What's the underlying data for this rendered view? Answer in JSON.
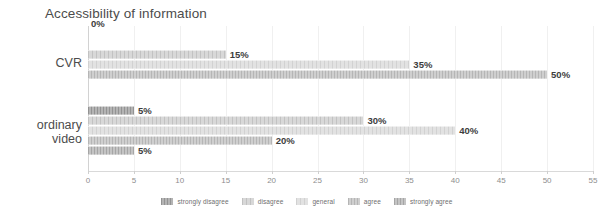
{
  "chart_data": {
    "type": "bar",
    "orientation": "horizontal",
    "title": "Accessibility of information",
    "xlabel": "",
    "ylabel": "",
    "xlim": [
      0,
      55
    ],
    "xticks": [
      0,
      5,
      10,
      15,
      20,
      25,
      30,
      35,
      40,
      45,
      50,
      55
    ],
    "xtick_labels": [
      "0",
      "5",
      "10",
      "15",
      "20",
      "25",
      "30",
      "35",
      "40",
      "45",
      "50",
      "55"
    ],
    "grid": true,
    "legend_position": "bottom-center",
    "categories": [
      "CVR",
      "ordinary video"
    ],
    "series": [
      {
        "name": "strongly disagree",
        "values": [
          0,
          5
        ],
        "labels": [
          "0%",
          "5%"
        ],
        "color": "#b4b4b4"
      },
      {
        "name": "disagree",
        "values": [
          15,
          30
        ],
        "labels": [
          "15%",
          "30%"
        ],
        "color": "#d8d8d8"
      },
      {
        "name": "general",
        "values": [
          35,
          40
        ],
        "labels": [
          "35%",
          "40%"
        ],
        "color": "#e2e2e2"
      },
      {
        "name": "agree",
        "values": [
          50,
          20
        ],
        "labels": [
          "50%",
          "20%"
        ],
        "color": "#cfcfcf"
      },
      {
        "name": "strongly agree",
        "values": [
          0,
          5
        ],
        "labels": [
          "",
          "5%"
        ],
        "color": "#c4c4c4"
      }
    ]
  },
  "chart": {
    "title": "Accessibility of information",
    "categories": {
      "cvr": "CVR",
      "ordinary_line1": "ordinary",
      "ordinary_line2": "video"
    },
    "axis": {
      "ticks": [
        "0",
        "5",
        "10",
        "15",
        "20",
        "25",
        "30",
        "35",
        "40",
        "45",
        "50",
        "55"
      ]
    },
    "cvr_labels": {
      "strongly_disagree": "0%",
      "disagree": "15%",
      "general": "35%",
      "agree": "50%"
    },
    "ordinary_labels": {
      "strongly_disagree": "5%",
      "disagree": "30%",
      "general": "40%",
      "agree": "20%",
      "strongly_agree": "5%"
    },
    "legend": [
      "strongly disagree",
      "disagree",
      "general",
      "agree",
      "strongly agree"
    ]
  }
}
